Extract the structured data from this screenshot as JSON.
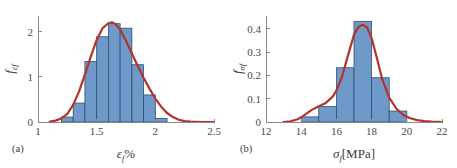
{
  "figure": {
    "background": "#ffffff",
    "bar_fill": "#6f99c9",
    "bar_edge": "#2f4f73",
    "curve_color": "#b5332a",
    "axis_color": "#8a8a8a",
    "text_color": "#3b3b3b"
  },
  "panels": [
    {
      "key": "a",
      "label": "(a)",
      "xlabel_main": "ε",
      "xlabel_sub": "f",
      "xlabel_tail": "%",
      "ylabel_main": "f",
      "ylabel_sub": "εf",
      "xticks": [
        "1",
        "1.5",
        "2",
        "2.5"
      ],
      "xtick_values": [
        1,
        1.5,
        2,
        2.5
      ],
      "yticks": [
        "0",
        "1",
        "2"
      ],
      "ytick_values": [
        0,
        1,
        2
      ]
    },
    {
      "key": "b",
      "label": "(b)",
      "xlabel_main": "σ",
      "xlabel_sub": "f",
      "xlabel_tail": "[MPa]",
      "ylabel_main": "f",
      "ylabel_sub": "σf",
      "xticks": [
        "12",
        "14",
        "16",
        "18",
        "20",
        "22"
      ],
      "xtick_values": [
        12,
        14,
        16,
        18,
        20,
        22
      ],
      "yticks": [
        "0",
        "0.1",
        "0.2",
        "0.3",
        "0.4"
      ],
      "ytick_values": [
        0,
        0.1,
        0.2,
        0.3,
        0.4
      ]
    }
  ],
  "chart_data": [
    {
      "type": "bar",
      "panel": "a",
      "title": "(a) Probability density of failure strain",
      "xlabel": "ε_f %",
      "ylabel": "f_(εf)",
      "xlim": [
        1,
        2.5
      ],
      "ylim": [
        0,
        2.35
      ],
      "grid": false,
      "legend": "none",
      "bin_edges": [
        1.2,
        1.3,
        1.4,
        1.5,
        1.6,
        1.7,
        1.8,
        1.9,
        2.0,
        2.1
      ],
      "bin_centers": [
        1.25,
        1.35,
        1.45,
        1.55,
        1.65,
        1.75,
        1.85,
        1.95,
        2.05
      ],
      "values": [
        0.11,
        0.42,
        1.34,
        1.89,
        2.18,
        2.08,
        1.27,
        0.6,
        0.08
      ],
      "fit_curve": {
        "name": "kernel density fit",
        "color": "#b5332a",
        "peak_x": 1.63,
        "peak_y": 2.21,
        "x": [
          1.1,
          1.15,
          1.2,
          1.25,
          1.3,
          1.35,
          1.4,
          1.45,
          1.5,
          1.55,
          1.6,
          1.63,
          1.66,
          1.7,
          1.75,
          1.8,
          1.85,
          1.9,
          1.95,
          2.0,
          2.05,
          2.1,
          2.15,
          2.2,
          2.25,
          2.3,
          2.4,
          2.5
        ],
        "y": [
          0.01,
          0.03,
          0.08,
          0.18,
          0.38,
          0.68,
          1.05,
          1.45,
          1.82,
          2.08,
          2.19,
          2.21,
          2.17,
          2.05,
          1.8,
          1.52,
          1.24,
          0.98,
          0.74,
          0.52,
          0.34,
          0.2,
          0.11,
          0.05,
          0.02,
          0.01,
          0.0,
          0.0
        ]
      }
    },
    {
      "type": "bar",
      "panel": "b",
      "title": "(b) Probability density of failure stress",
      "xlabel": "σ_f [MPa]",
      "ylabel": "f_(σf)",
      "xlim": [
        12,
        22
      ],
      "ylim": [
        0,
        0.455
      ],
      "grid": false,
      "legend": "none",
      "bin_edges": [
        14,
        15,
        16,
        17,
        18,
        19,
        20
      ],
      "bin_centers": [
        14.5,
        15.5,
        16.5,
        17.5,
        18.5,
        19.5
      ],
      "values": [
        0.022,
        0.066,
        0.233,
        0.432,
        0.19,
        0.047
      ],
      "fit_curve": {
        "name": "kernel density fit",
        "color": "#b5332a",
        "peak_x": 17.5,
        "peak_y": 0.418,
        "x": [
          13.0,
          13.4,
          13.8,
          14.0,
          14.3,
          14.6,
          15.0,
          15.4,
          15.8,
          16.0,
          16.3,
          16.6,
          17.0,
          17.25,
          17.5,
          17.75,
          18.0,
          18.3,
          18.6,
          19.0,
          19.4,
          19.8,
          20.2,
          20.6,
          21.0,
          21.4,
          21.8,
          22.0
        ],
        "y": [
          0.0,
          0.003,
          0.012,
          0.02,
          0.036,
          0.052,
          0.068,
          0.082,
          0.11,
          0.135,
          0.19,
          0.27,
          0.375,
          0.408,
          0.418,
          0.405,
          0.36,
          0.275,
          0.185,
          0.105,
          0.058,
          0.03,
          0.016,
          0.008,
          0.004,
          0.002,
          0.001,
          0.0
        ]
      }
    }
  ]
}
